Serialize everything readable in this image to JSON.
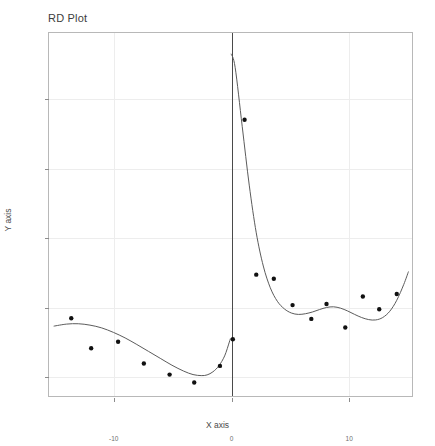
{
  "chart_data": {
    "type": "scatter",
    "title": "RD Plot",
    "xlabel": "X axis",
    "ylabel": "Y axis",
    "xlim": [
      -15.5,
      15.5
    ],
    "ylim": [
      340,
      1390
    ],
    "xticks": [
      -10,
      0,
      10
    ],
    "xtick_labels": [
      "-10",
      "0",
      "10"
    ],
    "yticks": [
      400,
      600,
      800,
      1000,
      1200
    ],
    "ytick_labels": [
      "400",
      "600",
      "800",
      "1000",
      "1200"
    ],
    "grid": true,
    "legend": "none",
    "cutoff": 0,
    "annotations": [
      "vertical cutoff line at x = 0"
    ],
    "series": [
      {
        "name": "Binned means (left of cutoff)",
        "type": "scatter",
        "points": [
          {
            "x": -13.6,
            "y": 565
          },
          {
            "x": -11.9,
            "y": 478
          },
          {
            "x": -9.6,
            "y": 497
          },
          {
            "x": -7.4,
            "y": 434
          },
          {
            "x": -5.2,
            "y": 402
          },
          {
            "x": -3.1,
            "y": 379
          },
          {
            "x": -0.9,
            "y": 427
          }
        ]
      },
      {
        "name": "Binned means (right of cutoff)",
        "type": "scatter",
        "points": [
          {
            "x": 0.2,
            "y": 504
          },
          {
            "x": 2.2,
            "y": 691
          },
          {
            "x": 1.2,
            "y": 1139
          },
          {
            "x": 3.7,
            "y": 679
          },
          {
            "x": 5.3,
            "y": 603
          },
          {
            "x": 6.9,
            "y": 563
          },
          {
            "x": 8.2,
            "y": 606
          },
          {
            "x": 9.8,
            "y": 538
          },
          {
            "x": 11.3,
            "y": 628
          },
          {
            "x": 12.7,
            "y": 591
          },
          {
            "x": 14.2,
            "y": 635
          }
        ]
      },
      {
        "name": "Polynomial fit (left of cutoff)",
        "type": "line",
        "points": [
          {
            "x": -15.1,
            "y": 542
          },
          {
            "x": -14.0,
            "y": 548
          },
          {
            "x": -13.0,
            "y": 549
          },
          {
            "x": -12.0,
            "y": 545
          },
          {
            "x": -11.0,
            "y": 537
          },
          {
            "x": -10.0,
            "y": 524
          },
          {
            "x": -9.0,
            "y": 508
          },
          {
            "x": -8.0,
            "y": 489
          },
          {
            "x": -7.0,
            "y": 469
          },
          {
            "x": -6.0,
            "y": 449
          },
          {
            "x": -5.0,
            "y": 429
          },
          {
            "x": -4.0,
            "y": 412
          },
          {
            "x": -3.2,
            "y": 402
          },
          {
            "x": -2.5,
            "y": 399
          },
          {
            "x": -2.0,
            "y": 401
          },
          {
            "x": -1.5,
            "y": 410
          },
          {
            "x": -1.0,
            "y": 427
          },
          {
            "x": -0.5,
            "y": 456
          },
          {
            "x": -0.1,
            "y": 496
          },
          {
            "x": 0.0,
            "y": 507
          }
        ]
      },
      {
        "name": "Polynomial fit (right of cutoff)",
        "type": "line",
        "points": [
          {
            "x": 0.05,
            "y": 1330
          },
          {
            "x": 0.4,
            "y": 1290
          },
          {
            "x": 1.0,
            "y": 1120
          },
          {
            "x": 1.6,
            "y": 950
          },
          {
            "x": 2.2,
            "y": 812
          },
          {
            "x": 2.8,
            "y": 716
          },
          {
            "x": 3.4,
            "y": 653
          },
          {
            "x": 4.0,
            "y": 614
          },
          {
            "x": 4.6,
            "y": 592
          },
          {
            "x": 5.2,
            "y": 580
          },
          {
            "x": 5.8,
            "y": 576
          },
          {
            "x": 6.4,
            "y": 578
          },
          {
            "x": 7.0,
            "y": 583
          },
          {
            "x": 7.6,
            "y": 590
          },
          {
            "x": 8.2,
            "y": 596
          },
          {
            "x": 8.8,
            "y": 598
          },
          {
            "x": 9.4,
            "y": 594
          },
          {
            "x": 10.0,
            "y": 586
          },
          {
            "x": 10.6,
            "y": 576
          },
          {
            "x": 11.2,
            "y": 567
          },
          {
            "x": 11.8,
            "y": 561
          },
          {
            "x": 12.4,
            "y": 560
          },
          {
            "x": 13.0,
            "y": 567
          },
          {
            "x": 13.6,
            "y": 585
          },
          {
            "x": 14.2,
            "y": 617
          },
          {
            "x": 14.8,
            "y": 663
          },
          {
            "x": 15.2,
            "y": 700
          }
        ]
      }
    ]
  }
}
